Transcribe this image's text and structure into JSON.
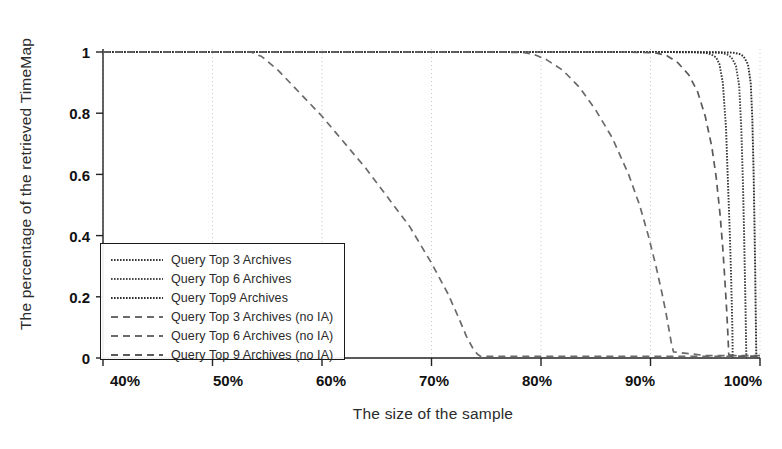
{
  "chart_data": {
    "type": "line",
    "title": "",
    "xlabel": "The size of the sample",
    "ylabel": "The percentage of the retrieved TimeMap",
    "xlim": [
      40,
      100
    ],
    "ylim": [
      0,
      1
    ],
    "xticklabels": [
      "40%",
      "50%",
      "60%",
      "70%",
      "80%",
      "90%",
      "100%"
    ],
    "xtickvalues": [
      40,
      50,
      60,
      70,
      80,
      90,
      100
    ],
    "yticklabels": [
      "0",
      "0.2",
      "0.4",
      "0.6",
      "0.8",
      "1"
    ],
    "ytickvalues": [
      0,
      0.2,
      0.4,
      0.6,
      0.8,
      1
    ],
    "grid": "vertical-dotted",
    "legend_position": "center-left",
    "series": [
      {
        "name": "Query Top 3 Archives",
        "style": "fine-dotted",
        "color": "#3a3a3a",
        "x": [
          40,
          60,
          80,
          90,
          94,
          95,
          95.5,
          96,
          96.3,
          96.6,
          96.9,
          97.1,
          97.25,
          97.35,
          97.42,
          97.48,
          97.5,
          97.5
        ],
        "y": [
          1,
          1,
          1,
          1,
          0.999,
          0.997,
          0.993,
          0.982,
          0.96,
          0.9,
          0.75,
          0.55,
          0.4,
          0.28,
          0.18,
          0.09,
          0.02,
          0
        ]
      },
      {
        "name": "Query Top 6 Archives",
        "style": "fine-dotted",
        "color": "#4a4a4a",
        "x": [
          40,
          60,
          80,
          92,
          95.5,
          96.5,
          97,
          97.4,
          97.8,
          98.1,
          98.3,
          98.45,
          98.55,
          98.62,
          98.68,
          98.72,
          98.75,
          98.75
        ],
        "y": [
          1,
          1,
          1,
          1,
          0.999,
          0.997,
          0.992,
          0.982,
          0.955,
          0.89,
          0.74,
          0.56,
          0.4,
          0.27,
          0.16,
          0.07,
          0.015,
          0
        ]
      },
      {
        "name": "Query Top9 Archives",
        "style": "fine-dotted",
        "color": "#2e2e2e",
        "x": [
          40,
          60,
          80,
          93,
          96.5,
          97.5,
          98.1,
          98.5,
          98.9,
          99.15,
          99.3,
          99.42,
          99.5,
          99.56,
          99.6,
          99.64,
          99.66,
          99.66
        ],
        "y": [
          1,
          1,
          1,
          1,
          0.999,
          0.998,
          0.994,
          0.986,
          0.96,
          0.9,
          0.78,
          0.6,
          0.43,
          0.29,
          0.17,
          0.07,
          0.015,
          0
        ]
      },
      {
        "name": "Query Top 3 Archives (no IA)",
        "style": "dashed",
        "color": "#6a6a6a",
        "x": [
          40,
          50,
          53.5,
          54.5,
          56,
          58,
          60,
          62,
          64,
          66,
          68,
          70,
          71.5,
          72.5,
          73.2,
          73.8,
          74.2,
          74.5,
          80,
          90,
          100
        ],
        "y": [
          1,
          1,
          1,
          0.985,
          0.94,
          0.865,
          0.79,
          0.705,
          0.62,
          0.525,
          0.43,
          0.31,
          0.21,
          0.13,
          0.07,
          0.03,
          0.012,
          0.005,
          0.005,
          0.005,
          0.005
        ]
      },
      {
        "name": "Query Top 6 Archives (no IA)",
        "style": "dashed",
        "color": "#6a6a6a",
        "x": [
          40,
          60,
          76,
          78.5,
          79.5,
          80.5,
          82,
          83.5,
          85,
          86.5,
          88,
          89,
          89.8,
          90.5,
          91,
          91.4,
          91.7,
          91.9,
          92.1,
          95,
          100
        ],
        "y": [
          1,
          1,
          1,
          0.998,
          0.99,
          0.975,
          0.94,
          0.885,
          0.81,
          0.72,
          0.6,
          0.5,
          0.4,
          0.3,
          0.22,
          0.15,
          0.09,
          0.05,
          0.02,
          0.008,
          0.008
        ]
      },
      {
        "name": "Query Top 9 Archives (no IA)",
        "style": "dashed",
        "color": "#5a5a5a",
        "x": [
          40,
          70,
          88,
          90.5,
          91.5,
          92.5,
          93.5,
          94.3,
          95,
          95.6,
          96,
          96.35,
          96.6,
          96.8,
          96.95,
          97.05,
          97.12,
          97.15,
          98,
          100
        ],
        "y": [
          1,
          1,
          1,
          0.997,
          0.988,
          0.965,
          0.925,
          0.87,
          0.79,
          0.69,
          0.59,
          0.47,
          0.36,
          0.25,
          0.16,
          0.09,
          0.035,
          0.01,
          0.005,
          0.005
        ]
      }
    ]
  },
  "legend": {
    "entries": [
      {
        "label": "Query Top 3 Archives"
      },
      {
        "label": "Query Top 6 Archives"
      },
      {
        "label": "Query Top9 Archives"
      },
      {
        "label": "Query Top 3 Archives (no IA)"
      },
      {
        "label": "Query Top 6 Archives (no IA)"
      },
      {
        "label": "Query Top 9 Archives (no IA)"
      }
    ]
  }
}
